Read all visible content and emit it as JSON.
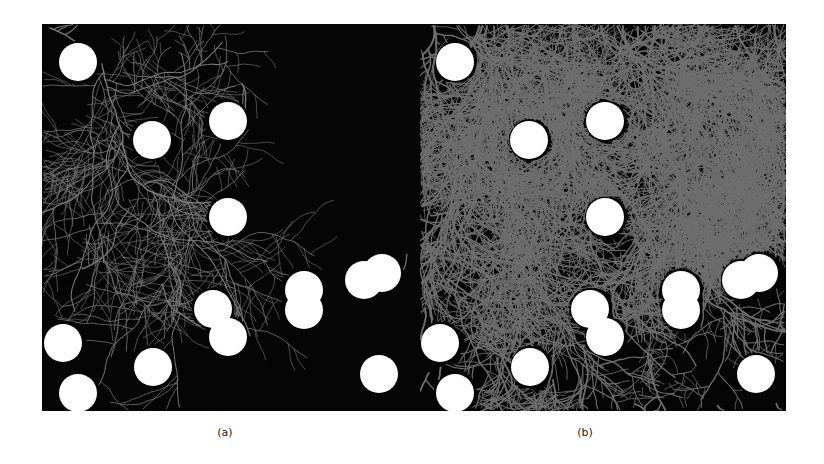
{
  "figure": {
    "panels": [
      {
        "id": "a",
        "caption": "(a)",
        "description": "Sparse dendritic growth among circular obstacles",
        "background_color": "#050505",
        "branch_color": "#7a7a7a",
        "density": "sparse"
      },
      {
        "id": "b",
        "caption": "(b)",
        "description": "Dense dendritic growth among circular obstacles",
        "background_color": "#050505",
        "branch_color": "#6e6e6e",
        "density": "dense"
      }
    ],
    "obstacle_color": "#ffffff",
    "obstacle_radius": 19,
    "obstacles": [
      [
        36,
        38
      ],
      [
        110,
        116
      ],
      [
        186,
        97
      ],
      [
        186,
        193
      ],
      [
        21,
        319
      ],
      [
        36,
        369
      ],
      [
        111,
        343
      ],
      [
        171,
        285
      ],
      [
        186,
        313
      ],
      [
        262,
        266
      ],
      [
        262,
        286
      ],
      [
        322,
        256
      ],
      [
        340,
        249
      ],
      [
        337,
        350
      ]
    ]
  }
}
